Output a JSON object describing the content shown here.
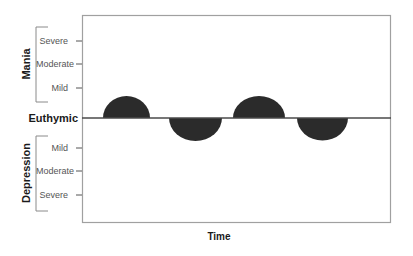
{
  "diagram": {
    "x_axis_label": "Time",
    "baseline_label": "Euthymic",
    "upper_group": {
      "label": "Mania",
      "levels": [
        "Severe",
        "Moderate",
        "Mild"
      ]
    },
    "lower_group": {
      "label": "Depression",
      "levels": [
        "Mild",
        "Moderate",
        "Severe"
      ]
    },
    "episodes": [
      {
        "type": "mania",
        "start_x": 103,
        "end_x": 150,
        "peak": "below Mild"
      },
      {
        "type": "depression",
        "start_x": 169,
        "end_x": 222,
        "peak": "below Mild"
      },
      {
        "type": "mania",
        "start_x": 233,
        "end_x": 285,
        "peak": "below Mild"
      },
      {
        "type": "depression",
        "start_x": 297,
        "end_x": 348,
        "peak": "below Mild"
      }
    ],
    "colors": {
      "frame": "#9a9a9a",
      "baseline": "#555555",
      "episode_fill": "#2b2b2b",
      "bracket": "#8a8a8a",
      "text": "#555555"
    }
  }
}
